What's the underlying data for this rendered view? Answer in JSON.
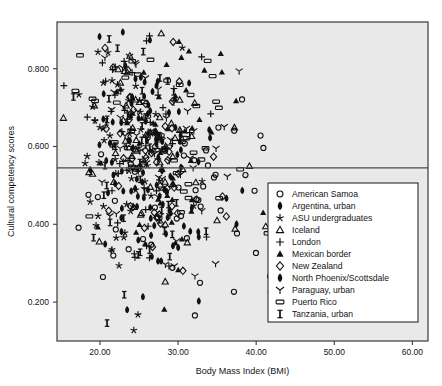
{
  "chart_data": {
    "type": "scatter",
    "title": "",
    "xlabel": "Body Mass Index (BMI)",
    "ylabel": "Cultural competency scores",
    "xlim": [
      14.5,
      62.0
    ],
    "ylim": [
      0.1,
      0.92
    ],
    "xticks": [
      "20.00",
      "30.00",
      "40.00",
      "50.00",
      "60.00"
    ],
    "xtick_values": [
      20,
      30,
      40,
      50,
      60
    ],
    "yticks": [
      "0.200",
      "0.400",
      "0.600",
      "0.800"
    ],
    "ytick_values": [
      0.2,
      0.4,
      0.6,
      0.8
    ],
    "grid": false,
    "legend_position": "lower-right-inside",
    "reference_line": {
      "orientation": "horizontal",
      "y": 0.545
    },
    "plot_background": "#e9e9e9",
    "marker_color": "#111111",
    "series": [
      {
        "name": "American Samoa",
        "marker": "open-circle",
        "n": 62,
        "x_mean": 31.5,
        "x_sd": 8.4,
        "y_mean": 0.5,
        "y_sd": 0.16,
        "seed": 11
      },
      {
        "name": "Argentina, urban",
        "marker": "filled-teardrop",
        "n": 58,
        "x_mean": 25.6,
        "x_sd": 3.6,
        "y_mean": 0.6,
        "y_sd": 0.16,
        "seed": 23
      },
      {
        "name": "ASU undergraduates",
        "marker": "star",
        "n": 55,
        "x_mean": 23.4,
        "x_sd": 3.5,
        "y_mean": 0.55,
        "y_sd": 0.17,
        "seed": 37
      },
      {
        "name": "Iceland",
        "marker": "open-triangle",
        "n": 54,
        "x_mean": 26.4,
        "x_sd": 4.3,
        "y_mean": 0.64,
        "y_sd": 0.14,
        "seed": 41
      },
      {
        "name": "London",
        "marker": "plus",
        "n": 52,
        "x_mean": 24.6,
        "x_sd": 3.8,
        "y_mean": 0.6,
        "y_sd": 0.16,
        "seed": 53
      },
      {
        "name": "Mexican border",
        "marker": "filled-triangle",
        "n": 50,
        "x_mean": 28.4,
        "x_sd": 4.4,
        "y_mean": 0.58,
        "y_sd": 0.15,
        "seed": 67
      },
      {
        "name": "New Zealand",
        "marker": "open-diamond",
        "n": 48,
        "x_mean": 25.8,
        "x_sd": 4.0,
        "y_mean": 0.64,
        "y_sd": 0.15,
        "seed": 71
      },
      {
        "name": "North Phoenix/Scottsdale",
        "marker": "filled-teardrop2",
        "n": 50,
        "x_mean": 25.4,
        "x_sd": 3.7,
        "y_mean": 0.58,
        "y_sd": 0.16,
        "seed": 83
      },
      {
        "name": "Paraguay, urban",
        "marker": "wye",
        "n": 52,
        "x_mean": 26.8,
        "x_sd": 4.4,
        "y_mean": 0.62,
        "y_sd": 0.15,
        "seed": 97
      },
      {
        "name": "Puerto Rico",
        "marker": "open-rect",
        "n": 46,
        "x_mean": 27.2,
        "x_sd": 4.6,
        "y_mean": 0.65,
        "y_sd": 0.14,
        "seed": 101
      },
      {
        "name": "Tanzania, urban",
        "marker": "ibeam",
        "n": 44,
        "x_mean": 24.2,
        "x_sd": 3.4,
        "y_mean": 0.58,
        "y_sd": 0.17,
        "seed": 113
      }
    ]
  },
  "legend": {
    "items": [
      {
        "label": "American Samoa",
        "marker": "open-circle"
      },
      {
        "label": "Argentina, urban",
        "marker": "filled-teardrop"
      },
      {
        "label": "ASU undergraduates",
        "marker": "star"
      },
      {
        "label": "Iceland",
        "marker": "open-triangle"
      },
      {
        "label": "London",
        "marker": "plus"
      },
      {
        "label": "Mexican border",
        "marker": "filled-triangle"
      },
      {
        "label": "New Zealand",
        "marker": "open-diamond"
      },
      {
        "label": "North Phoenix/Scottsdale",
        "marker": "filled-teardrop2"
      },
      {
        "label": "Paraguay, urban",
        "marker": "wye"
      },
      {
        "label": "Puerto Rico",
        "marker": "open-rect"
      },
      {
        "label": "Tanzania, urban",
        "marker": "ibeam"
      }
    ]
  }
}
